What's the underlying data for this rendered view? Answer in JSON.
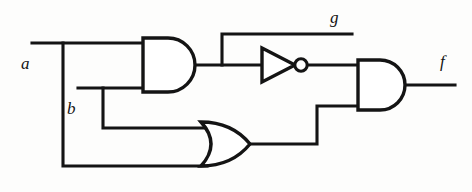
{
  "figure": {
    "kind": "logic-circuit-schematic",
    "width": 472,
    "height": 192,
    "background_color": "#fdfdfc",
    "line_color": "#141414"
  },
  "labels": {
    "input_a": "a",
    "input_b": "b",
    "internal_g": "g",
    "output_f": "f"
  },
  "gates": [
    {
      "id": "and1",
      "type": "AND",
      "label": "AND gate 1",
      "inputs": [
        "a",
        "b"
      ],
      "output": "g"
    },
    {
      "id": "not1",
      "type": "NOT",
      "label": "Inverter",
      "inputs": [
        "g"
      ],
      "output": "not-g"
    },
    {
      "id": "or1",
      "type": "OR",
      "label": "OR gate",
      "inputs": [
        "b",
        "a"
      ],
      "output": "a-or-b"
    },
    {
      "id": "and2",
      "type": "AND",
      "label": "AND gate 2",
      "inputs": [
        "not-g",
        "a-or-b"
      ],
      "output": "f"
    }
  ],
  "nets": [
    {
      "id": "net-a",
      "from": "a",
      "to": [
        "and1.in1",
        "or1.in2"
      ]
    },
    {
      "id": "net-b",
      "from": "b",
      "to": [
        "and1.in2",
        "or1.in1"
      ]
    },
    {
      "id": "net-g",
      "from": "and1.out",
      "to": [
        "not1.in",
        "g"
      ]
    },
    {
      "id": "net-notg",
      "from": "not1.out",
      "to": [
        "and2.in1"
      ]
    },
    {
      "id": "net-or",
      "from": "or1.out",
      "to": [
        "and2.in2"
      ]
    },
    {
      "id": "net-f",
      "from": "and2.out",
      "to": [
        "f"
      ]
    }
  ]
}
